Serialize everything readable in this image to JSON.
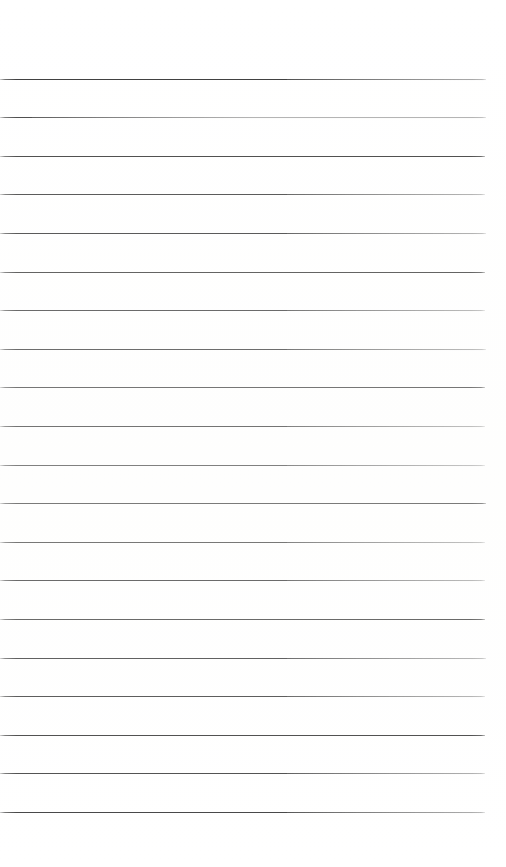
{
  "document": {
    "type": "scanned-ruled-paper",
    "title": "Blank Ruled Notebook Page",
    "page_width": 506,
    "page_height": 867,
    "background_color": "#ffffff",
    "content_text": "",
    "is_blank": true
  },
  "ruling": {
    "line_color": "#262626",
    "line_thickness_px": 1.3,
    "line_count": 20,
    "first_line_y": 79,
    "line_spacing_px": 38.6,
    "last_line_y": 812,
    "line_start_x": 0,
    "line_end_x": 485,
    "line_length_px": 485,
    "top_margin_px": 79,
    "bottom_margin_px": 55,
    "left_margin_px": 0,
    "right_margin_px": 21,
    "lines": [
      {
        "index": 1,
        "y": 79.0,
        "x1": 0,
        "x2": 486,
        "opacity": 0.92,
        "tilt_deg": 0.02
      },
      {
        "index": 2,
        "y": 117.2,
        "x1": 0,
        "x2": 486,
        "opacity": 0.88,
        "tilt_deg": 0.03
      },
      {
        "index": 3,
        "y": 155.8,
        "x1": 0,
        "x2": 485,
        "opacity": 0.9,
        "tilt_deg": 0.01
      },
      {
        "index": 4,
        "y": 194.4,
        "x1": 0,
        "x2": 485,
        "opacity": 0.87,
        "tilt_deg": 0.02
      },
      {
        "index": 5,
        "y": 233.0,
        "x1": 0,
        "x2": 486,
        "opacity": 0.91,
        "tilt_deg": 0.02
      },
      {
        "index": 6,
        "y": 271.6,
        "x1": 0,
        "x2": 485,
        "opacity": 0.89,
        "tilt_deg": 0.01
      },
      {
        "index": 7,
        "y": 310.2,
        "x1": 0,
        "x2": 485,
        "opacity": 0.88,
        "tilt_deg": 0.02
      },
      {
        "index": 8,
        "y": 348.8,
        "x1": 0,
        "x2": 486,
        "opacity": 0.9,
        "tilt_deg": 0.02
      },
      {
        "index": 9,
        "y": 387.4,
        "x1": 0,
        "x2": 485,
        "opacity": 0.87,
        "tilt_deg": 0.01
      },
      {
        "index": 10,
        "y": 426.0,
        "x1": 0,
        "x2": 485,
        "opacity": 0.92,
        "tilt_deg": 0.02
      },
      {
        "index": 11,
        "y": 464.6,
        "x1": 0,
        "x2": 485,
        "opacity": 0.88,
        "tilt_deg": 0.02
      },
      {
        "index": 12,
        "y": 503.2,
        "x1": 0,
        "x2": 486,
        "opacity": 0.9,
        "tilt_deg": 0.01
      },
      {
        "index": 13,
        "y": 541.8,
        "x1": 0,
        "x2": 485,
        "opacity": 0.87,
        "tilt_deg": 0.02
      },
      {
        "index": 14,
        "y": 580.4,
        "x1": 0,
        "x2": 485,
        "opacity": 0.91,
        "tilt_deg": 0.02
      },
      {
        "index": 15,
        "y": 619.0,
        "x1": 0,
        "x2": 485,
        "opacity": 0.88,
        "tilt_deg": 0.01
      },
      {
        "index": 16,
        "y": 657.6,
        "x1": 0,
        "x2": 486,
        "opacity": 0.89,
        "tilt_deg": 0.02
      },
      {
        "index": 17,
        "y": 696.2,
        "x1": 0,
        "x2": 485,
        "opacity": 0.87,
        "tilt_deg": 0.02
      },
      {
        "index": 18,
        "y": 734.8,
        "x1": 0,
        "x2": 485,
        "opacity": 0.9,
        "tilt_deg": 0.01
      },
      {
        "index": 19,
        "y": 773.4,
        "x1": 0,
        "x2": 485,
        "opacity": 0.86,
        "tilt_deg": 0.02
      },
      {
        "index": 20,
        "y": 812.0,
        "x1": 0,
        "x2": 485,
        "opacity": 0.88,
        "tilt_deg": 0.02
      }
    ]
  }
}
